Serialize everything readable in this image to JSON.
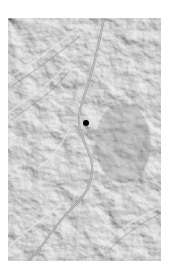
{
  "map": {
    "style": "grayscale-shaded-relief",
    "bounds_px": {
      "left": 8,
      "top": 18,
      "width": 153,
      "height": 243
    },
    "colors": {
      "base": "#bdbdbd",
      "light": "#e2e2e2",
      "dark": "#8f8f8f",
      "river": "#9a9a9a",
      "marker": "#000000"
    },
    "features": {
      "river": "winding river valley running from top-center through middle to bottom-left"
    },
    "markers": [
      {
        "id": "location-marker",
        "x_px": 86,
        "y_px": 123,
        "diameter_px": 6,
        "color": "#000000"
      }
    ]
  }
}
